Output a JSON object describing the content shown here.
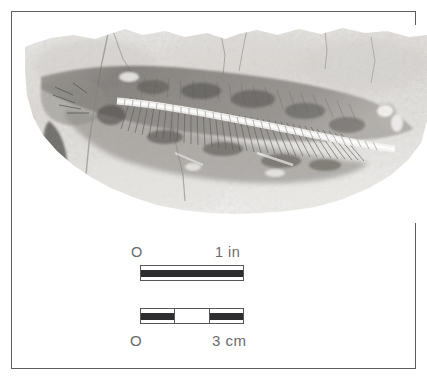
{
  "figure": {
    "type": "photographic-plate",
    "background_color": "#ffffff",
    "frame_color": "#5d5d5f"
  },
  "photo": {
    "caption_alt": "grayscale photograph of an elongate fossil fish or reptile preserved in a rock slab, vertebral column running left to right",
    "tone_light": "#eceae7",
    "tone_mid": "#b9b6b1",
    "tone_dark": "#6f6d6a",
    "tone_darkest": "#3c3b39"
  },
  "scale_inch": {
    "zero_label": "O",
    "end_label": "1 in",
    "segments": [
      {
        "fill": "dark"
      }
    ]
  },
  "scale_cm": {
    "zero_label": "O",
    "end_label": "3 cm",
    "segments": [
      {
        "fill": "dark"
      },
      {
        "fill": "light"
      },
      {
        "fill": "dark"
      }
    ]
  }
}
